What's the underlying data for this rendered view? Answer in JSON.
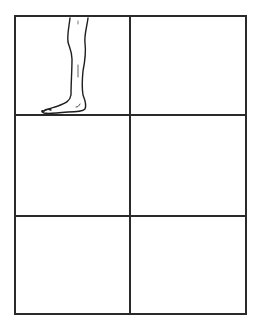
{
  "diagram": {
    "type": "storyboard-grid",
    "rows": 3,
    "columns": 2,
    "line_color": "#2a2a2a",
    "background": "#ffffff",
    "cells": [
      {
        "row": 1,
        "col": 1,
        "content": "leg-and-foot-drawing"
      },
      {
        "row": 1,
        "col": 2,
        "content": ""
      },
      {
        "row": 2,
        "col": 1,
        "content": ""
      },
      {
        "row": 2,
        "col": 2,
        "content": ""
      },
      {
        "row": 3,
        "col": 1,
        "content": ""
      },
      {
        "row": 3,
        "col": 2,
        "content": ""
      }
    ]
  }
}
